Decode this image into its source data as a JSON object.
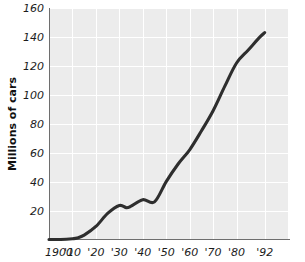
{
  "chart_data": {
    "type": "line",
    "title": "",
    "subtitle": "",
    "xlabel": "",
    "ylabel": "Millions of cars",
    "xlim": [
      1900,
      1992
    ],
    "ylim": [
      0,
      160
    ],
    "grid": true,
    "legend": null,
    "legend_position": "none",
    "line_color": "#2e2e2e",
    "plot_background": "#ececec",
    "gridline_color": "#ffffff",
    "axis_color": "#6e6e6e",
    "y_ticks": [
      0,
      20,
      40,
      60,
      80,
      100,
      120,
      140,
      160
    ],
    "y_tick_labels": [
      "",
      "20",
      "40",
      "60",
      "80",
      "100",
      "120",
      "140",
      "160"
    ],
    "x_ticks": [
      1900,
      1910,
      1920,
      1930,
      1940,
      1950,
      1960,
      1970,
      1980,
      1992
    ],
    "x_tick_labels": [
      "1900",
      "'10",
      "'20",
      "'30",
      "'40",
      "'50",
      "'60",
      "'70",
      "'80",
      "'92"
    ],
    "series": [
      {
        "name": "Cars in use",
        "x": [
          1900,
          1905,
          1910,
          1912,
          1915,
          1920,
          1925,
          1930,
          1933,
          1935,
          1940,
          1945,
          1950,
          1955,
          1960,
          1965,
          1970,
          1975,
          1980,
          1985,
          1990,
          1992
        ],
        "values": [
          0,
          0,
          0.5,
          1,
          3,
          9,
          18,
          23.5,
          22,
          23,
          27.5,
          26,
          40,
          52,
          62,
          75,
          89,
          106,
          122,
          131,
          140,
          143
        ]
      }
    ]
  },
  "axes": {
    "y_title": "Millions of cars"
  }
}
